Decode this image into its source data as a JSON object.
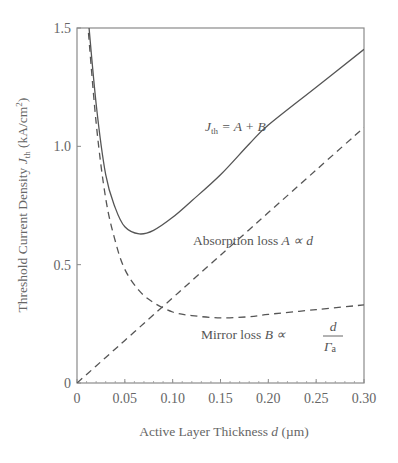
{
  "chart_data": {
    "type": "line",
    "title": "",
    "xlabel": "Active Layer Thickness  d  (µm)",
    "ylabel": "Threshold Current Density  Jth (kA/cm²)",
    "xlim": [
      0,
      0.3
    ],
    "ylim": [
      0,
      1.5
    ],
    "x_ticks": [
      "0",
      "0.05",
      "0.10",
      "0.15",
      "0.20",
      "0.25",
      "0.30"
    ],
    "y_ticks": [
      "0",
      "0.5",
      "1.0",
      "1.5"
    ],
    "grid": false,
    "legend": "none (inline annotations)",
    "x": [
      0.01,
      0.02,
      0.03,
      0.04,
      0.05,
      0.065,
      0.08,
      0.1,
      0.12,
      0.15,
      0.18,
      0.2,
      0.25,
      0.3
    ],
    "series": [
      {
        "name": "Jth = A + B",
        "style": "solid",
        "values": [
          1.62,
          1.18,
          0.88,
          0.74,
          0.66,
          0.63,
          0.645,
          0.7,
          0.77,
          0.88,
          1.01,
          1.09,
          1.25,
          1.41
        ]
      },
      {
        "name": "Absorption loss A ∝ d",
        "style": "dashed",
        "values": [
          0.036,
          0.072,
          0.108,
          0.144,
          0.18,
          0.234,
          0.288,
          0.36,
          0.432,
          0.54,
          0.648,
          0.72,
          0.9,
          1.08
        ]
      },
      {
        "name": "Mirror loss B ∝ d/Γa",
        "style": "dashed",
        "values": [
          1.58,
          1.1,
          0.78,
          0.6,
          0.48,
          0.39,
          0.34,
          0.3,
          0.285,
          0.275,
          0.28,
          0.29,
          0.31,
          0.33
        ]
      }
    ],
    "annotations": [
      {
        "text": "Jth = A + B",
        "x": 0.155,
        "y": 1.06
      },
      {
        "text": "Absorption loss  A ∝ d",
        "x": 0.11,
        "y": 0.62
      },
      {
        "text": "Mirror loss  B ∝ d / Γa",
        "x": 0.12,
        "y": 0.16
      }
    ]
  },
  "labels": {
    "y_axis": {
      "pre": "Threshold Current Density  ",
      "sym": "J",
      "sub": "th",
      "post": " (kA/cm",
      "sup": "2",
      "end": ")"
    },
    "x_axis": {
      "pre": "Active Layer Thickness  ",
      "sym": "d",
      "post": "  (µm)"
    },
    "jth": {
      "sym": "J",
      "sub": "th",
      "rest": " = A + B"
    },
    "absorption": {
      "text": "Absorption loss  ",
      "math": "A ∝ d"
    },
    "mirror": {
      "text": "Mirror loss  ",
      "math": "B ∝",
      "num": "d",
      "den": "Γ",
      "den_sub": "a"
    }
  },
  "colors": {
    "axis": "#888888",
    "curve": "#555555",
    "text": "#666666"
  }
}
